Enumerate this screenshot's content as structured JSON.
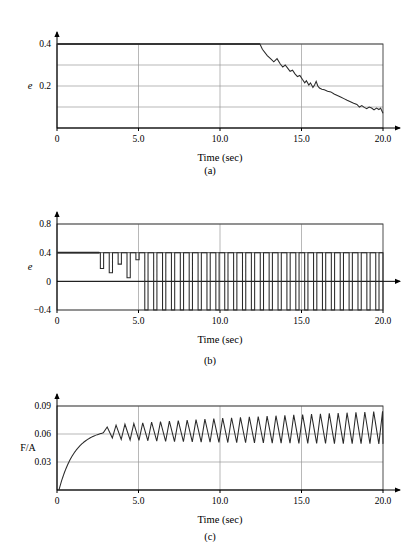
{
  "figure": {
    "width": 420,
    "height": 542,
    "background": "#ffffff",
    "trace_color": "#2a2a2a",
    "grid_color": "#9a9a9a",
    "axis_color": "#000000"
  },
  "chart_data": [
    {
      "id": "panel-a",
      "type": "line",
      "caption": "(a)",
      "title": "",
      "xlabel": "Time (sec)",
      "ylabel": "e",
      "ylabel_italic": true,
      "xlim": [
        0,
        20
      ],
      "ylim": [
        0,
        0.4
      ],
      "xticks": [
        0,
        5,
        10,
        15,
        20
      ],
      "xticklabels": [
        "0",
        "5.0",
        "10.0",
        "15.0",
        "20.0"
      ],
      "yticks": [
        0.1,
        0.2,
        0.3,
        0.4
      ],
      "yticklabels": [
        "",
        "0.2",
        "",
        "0.4"
      ],
      "grid": true,
      "legend": "none",
      "series": [
        {
          "name": "e",
          "x": [
            0.0,
            2.0,
            4.0,
            6.0,
            8.0,
            10.0,
            12.0,
            12.45,
            12.6,
            12.9,
            13.1,
            13.3,
            13.5,
            13.7,
            13.85,
            14.0,
            14.15,
            14.3,
            14.45,
            14.6,
            14.75,
            14.9,
            15.05,
            15.2,
            15.3,
            15.45,
            15.55,
            15.7,
            15.8,
            15.9,
            16.0,
            16.1,
            16.25,
            16.4,
            16.6,
            16.8,
            17.0,
            17.2,
            17.4,
            17.6,
            17.8,
            18.0,
            18.2,
            18.4,
            18.55,
            18.7,
            18.85,
            19.0,
            19.15,
            19.3,
            19.45,
            19.6,
            19.75,
            19.85,
            20.0
          ],
          "y": [
            0.4,
            0.4,
            0.4,
            0.4,
            0.4,
            0.4,
            0.4,
            0.4,
            0.375,
            0.345,
            0.33,
            0.315,
            0.33,
            0.305,
            0.29,
            0.3,
            0.285,
            0.27,
            0.275,
            0.258,
            0.245,
            0.25,
            0.232,
            0.215,
            0.225,
            0.205,
            0.215,
            0.193,
            0.205,
            0.222,
            0.2,
            0.19,
            0.185,
            0.182,
            0.175,
            0.172,
            0.162,
            0.155,
            0.148,
            0.14,
            0.132,
            0.125,
            0.118,
            0.112,
            0.1,
            0.107,
            0.098,
            0.092,
            0.1,
            0.095,
            0.086,
            0.095,
            0.088,
            0.095,
            0.07
          ]
        }
      ]
    },
    {
      "id": "panel-b",
      "type": "line",
      "caption": "(b)",
      "title": "",
      "xlabel": "Time (sec)",
      "ylabel": "e",
      "ylabel_italic": true,
      "xlim": [
        0,
        20
      ],
      "ylim": [
        -0.4,
        0.8
      ],
      "xticks": [
        0,
        5,
        10,
        15,
        20
      ],
      "xticklabels": [
        "0",
        "5.0",
        "10.0",
        "15.0",
        "20.0"
      ],
      "yticks": [
        -0.4,
        0,
        0.4,
        0.8
      ],
      "yticklabels": [
        "−0.4",
        "0",
        "0.4",
        "0.8"
      ],
      "zero_axis": 0,
      "grid": true,
      "legend": "none",
      "square_wave": {
        "description": "relay chattering: flat at 0.4 then downward pulses of growing depth saturating at -0.4",
        "high": 0.4,
        "low": -0.4,
        "flat_until": 2.6,
        "period": 0.545,
        "pulse_width": 0.2,
        "depths": [
          0.18,
          0.12,
          0.24,
          0.05,
          0.3,
          -0.1,
          0.2,
          -0.27,
          -0.4,
          -0.4
        ],
        "saturated_from": 5.3
      }
    },
    {
      "id": "panel-c",
      "type": "line",
      "caption": "(c)",
      "title": "",
      "xlabel": "Time (sec)",
      "ylabel": "F/A",
      "ylabel_italic": false,
      "xlim": [
        0,
        20
      ],
      "ylim": [
        0,
        0.09
      ],
      "xticks": [
        0,
        5,
        10,
        15,
        20
      ],
      "xticklabels": [
        "0",
        "5.0",
        "10.0",
        "15.0",
        "20.0"
      ],
      "yticks": [
        0.03,
        0.06,
        0.09
      ],
      "yticklabels": [
        "0.03",
        "0.06",
        "0.09"
      ],
      "grid": true,
      "legend": "none",
      "ramp_oscillation": {
        "description": "exponential rise to 0.065 then triangular oscillation with slowly growing envelope",
        "rise_tau": 1.0,
        "rise_start": 0.12,
        "rise_level": 0.0655,
        "osc_start": 2.85,
        "period": 0.545,
        "amp_start": 0.006,
        "amp_end": 0.018,
        "center_start": 0.0615,
        "center_end": 0.0665
      }
    }
  ]
}
